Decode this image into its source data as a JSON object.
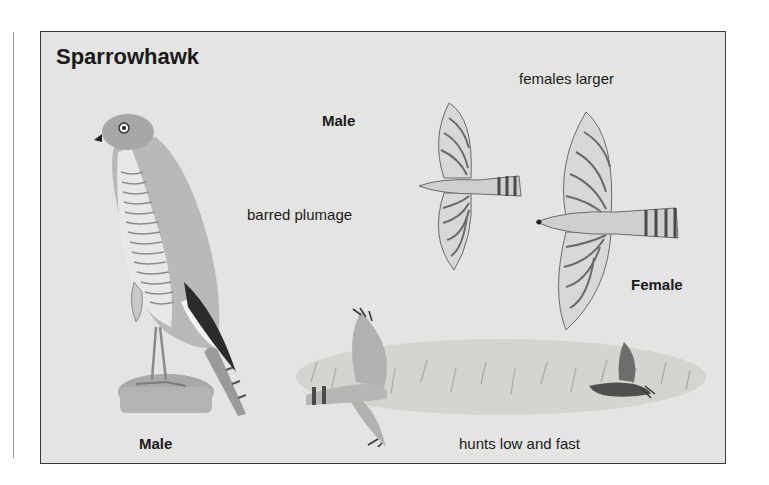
{
  "illustration": {
    "title": "Sparrowhawk",
    "labels": {
      "females_larger": "females larger",
      "male_flight": "Male",
      "barred_plumage": "barred plumage",
      "female_flight": "Female",
      "male_perched": "Male",
      "hunts": "hunts low and fast"
    },
    "colors": {
      "background": "#e4e4e2",
      "border": "#3a3a3a",
      "text": "#1a1a1a",
      "bar_dark": "#5a5a5a",
      "wing_dark": "#2b2b2b"
    }
  }
}
